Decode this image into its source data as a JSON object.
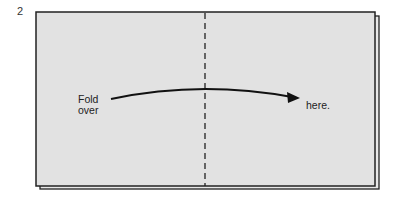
{
  "step": {
    "number": "2"
  },
  "instructions": {
    "left_text_line1": "Fold",
    "left_text_line2": "over",
    "right_text": "here."
  },
  "colors": {
    "paper": "#e2e2e2",
    "outline": "#222222",
    "arrow": "#111111"
  }
}
